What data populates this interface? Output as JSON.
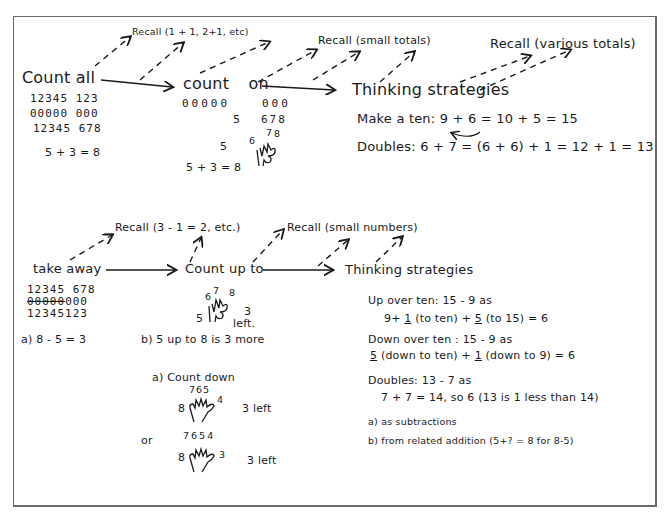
{
  "diagram": {
    "type": "strategy-progression",
    "addition": {
      "stages": [
        {
          "label": "Count all"
        },
        {
          "label": "count on"
        },
        {
          "label": "Thinking strategies"
        }
      ],
      "recall_labels": [
        "Recall (1 + 1, 2+1, etc)",
        "Recall (small totals)",
        "Recall (various totals)"
      ],
      "count_all_example": {
        "row1": "12345 123",
        "row2": "00000 000",
        "row3": "12345 678",
        "equation": "5 + 3 = 8"
      },
      "count_on_example": {
        "row1_left": "00000",
        "row1_right": "000",
        "row2_left": "5",
        "row2_right": "678",
        "hand_start": "5",
        "finger_labels": [
          "6",
          "7",
          "8"
        ],
        "equation": "5 + 3 = 8"
      },
      "thinking_strategies": [
        {
          "label": "Make a ten:",
          "expr": "9 + 6 = 10 + 5 = 15"
        },
        {
          "label": "Doubles:",
          "expr": "6 + 7 = (6 + 6) + 1 = 12 + 1 = 13"
        }
      ]
    },
    "subtraction": {
      "stages": [
        {
          "label": "take away"
        },
        {
          "label": "Count up to"
        },
        {
          "label": "Thinking strategies"
        }
      ],
      "recall_labels": [
        "Recall (3 - 1 = 2, etc.)",
        "Recall (small numbers)"
      ],
      "take_away_example": {
        "row1": "12345 678",
        "row2_struck": "00000",
        "row2_plain": "000",
        "row3": "12345123",
        "caption": "a)  8 - 5 = 3"
      },
      "count_up_example": {
        "hand_start": "5",
        "finger_labels": [
          "6",
          "7",
          "8"
        ],
        "result_number": "3",
        "result_word": "left.",
        "caption": "b) 5 up to 8 is 3 more"
      },
      "count_down": {
        "title": "a) Count down",
        "variant1": {
          "left": "8",
          "top": "765",
          "right": "4",
          "result": "3 left"
        },
        "or_label": "or",
        "variant2": {
          "left": "8",
          "top": "7654",
          "right": "3",
          "result": "3 left"
        }
      },
      "thinking_strategies": [
        {
          "label": "Up over ten: 15 - 9 as",
          "detail": [
            "9+ ",
            "1",
            " (to ten) + ",
            "5",
            " (to 15) = 6"
          ]
        },
        {
          "label": "Down over ten : 15 - 9 as",
          "detail": [
            "5",
            " (down to ten) + ",
            "1",
            " (down to 9) = 6"
          ]
        },
        {
          "label": "Doubles: 13 - 7 as",
          "detail": [
            "7 + 7 = 14, so 6 (13 is 1 less than 14)"
          ]
        }
      ],
      "notes": [
        "a) as subtractions",
        "b) from related addition (5+? = 8 for 8-5)"
      ]
    }
  },
  "colors": {
    "ink": "#1a1a1a",
    "frame": "#6a6a6a",
    "background": "#ffffff"
  }
}
